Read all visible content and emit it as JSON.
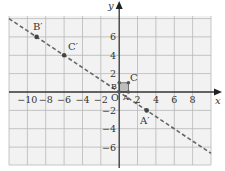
{
  "figure": {
    "x_axis_label": "x",
    "y_axis_label": "y",
    "origin_label": "O",
    "x_tick_labels": [
      "−10",
      "−8",
      "−6",
      "−4",
      "−2",
      "2",
      "4",
      "6",
      "8"
    ],
    "y_tick_labels": [
      "6",
      "4",
      "2",
      "−2",
      "−4",
      "−6"
    ],
    "points": {
      "A": {
        "label": "A",
        "x": 1,
        "y": 0
      },
      "B": {
        "label": "B",
        "x": 0,
        "y": 1
      },
      "C": {
        "label": "C",
        "x": 1,
        "y": 1
      },
      "A_prime": {
        "label": "A′",
        "x": 3,
        "y": -2
      },
      "B_prime": {
        "label": "B′",
        "x": -9,
        "y": 6
      },
      "C_prime": {
        "label": "C′",
        "x": -6,
        "y": 4
      }
    },
    "line": {
      "style": "dashed",
      "through": [
        "C′",
        "A′"
      ],
      "slope": -0.6667
    },
    "colors": {
      "grid_fill": "#f2f2f2",
      "grid_line": "#b8b8b8",
      "axis": "#333333",
      "dashed_line": "#666666",
      "point": "#444444",
      "square_fill": "#bdbdbd"
    }
  }
}
